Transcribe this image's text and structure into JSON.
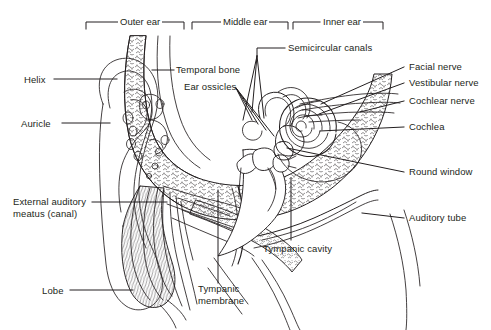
{
  "figure": {
    "ink_color": "#231f20",
    "background_color": "#ffffff",
    "width": 491,
    "height": 330
  },
  "region_brackets": [
    {
      "id": "outer-ear",
      "label": "Outer ear",
      "x_start": 86,
      "x_end": 184,
      "y": 22
    },
    {
      "id": "middle-ear",
      "label": "Middle ear",
      "x_start": 192,
      "x_end": 288,
      "y": 22
    },
    {
      "id": "inner-ear",
      "label": "Inner ear",
      "x_start": 293,
      "x_end": 383,
      "y": 22
    }
  ],
  "labels": [
    {
      "id": "helix",
      "text": "Helix",
      "side": "left",
      "x": 24,
      "y": 76,
      "leader_to_x": 117,
      "leader_to_y": 82
    },
    {
      "id": "auricle",
      "text": "Auricle",
      "side": "left",
      "x": 21,
      "y": 120,
      "leader_to_x": 110,
      "leader_to_y": 126
    },
    {
      "id": "external-auditory-meatus",
      "text": "External auditory meatus (canal)",
      "line1": "External auditory",
      "line2": "meatus (canal)",
      "side": "left",
      "x": 14,
      "y": 199,
      "leader_to_x": 167,
      "leader_to_y": 205
    },
    {
      "id": "lobe",
      "text": "Lobe",
      "side": "left",
      "x": 42,
      "y": 287,
      "leader_to_x": 133,
      "leader_to_y": 293
    },
    {
      "id": "temporal-bone",
      "text": "Temporal bone",
      "side": "center",
      "x": 176,
      "y": 64,
      "leader_to_x": 152,
      "leader_to_y": 72
    },
    {
      "id": "ear-ossicles",
      "text": "Ear ossicles",
      "side": "center",
      "x": 186,
      "y": 81,
      "leader_to_x": 250,
      "leader_to_y": 122
    },
    {
      "id": "semicircular-canals",
      "text": "Semicircular canals",
      "side": "center",
      "x": 287,
      "y": 51,
      "leader_to_x": 245,
      "leader_to_y": 120
    },
    {
      "id": "tympanic-cavity",
      "text": "Tympanic cavity",
      "side": "bottom",
      "x": 263,
      "y": 243,
      "leader_to_x": 291,
      "leader_to_y": 180
    },
    {
      "id": "tympanic-membrane",
      "text": "Tympanic membrane",
      "line1": "Tympanic",
      "line2": "membrane",
      "side": "bottom",
      "x": 199,
      "y": 284,
      "leader_to_x": 218,
      "leader_to_y": 190
    },
    {
      "id": "facial-nerve",
      "text": "Facial nerve",
      "side": "right",
      "x": 409,
      "y": 64,
      "leader_to_x": 321,
      "leader_to_y": 104
    },
    {
      "id": "vestibular-nerve",
      "text": "Vestibular nerve",
      "side": "right",
      "x": 409,
      "y": 80,
      "leader_to_x": 318,
      "leader_to_y": 114
    },
    {
      "id": "cochlear-nerve",
      "text": "Cochlear nerve",
      "side": "right",
      "x": 409,
      "y": 98,
      "leader_to_x": 355,
      "leader_to_y": 112
    },
    {
      "id": "cochlea",
      "text": "Cochlea",
      "side": "right",
      "x": 409,
      "y": 124,
      "leader_to_x": 318,
      "leader_to_y": 130
    },
    {
      "id": "round-window",
      "text": "Round window",
      "side": "right",
      "x": 409,
      "y": 169,
      "leader_to_x": 287,
      "leader_to_y": 146
    },
    {
      "id": "auditory-tube",
      "text": "Auditory tube",
      "side": "right",
      "x": 409,
      "y": 215,
      "leader_to_x": 362,
      "leader_to_y": 213
    }
  ],
  "anatomy_parts": [
    "auricle-outline",
    "helix-fold",
    "concha",
    "external-auditory-canal",
    "ear-lobe",
    "temporal-bone-spongy",
    "tympanic-membrane",
    "malleus",
    "incus",
    "stapes",
    "tympanic-cavity",
    "semicircular-canals",
    "vestibule",
    "cochlea-spiral",
    "vestibulocochlear-nerve",
    "facial-nerve",
    "round-window",
    "eustachian-auditory-tube"
  ]
}
